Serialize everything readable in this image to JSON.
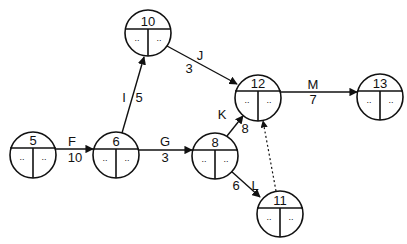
{
  "diagram": {
    "type": "activity-on-arrow network",
    "nodes": [
      {
        "id": "5",
        "label": "5",
        "cx": 33,
        "cy": 155,
        "left": "..",
        "right": ".."
      },
      {
        "id": "6",
        "label": "6",
        "cx": 116,
        "cy": 155,
        "left": "..",
        "right": ".."
      },
      {
        "id": "10",
        "label": "10",
        "cx": 148,
        "cy": 33,
        "left": "..",
        "right": ".."
      },
      {
        "id": "8",
        "label": "8",
        "cx": 215,
        "cy": 156,
        "left": "..",
        "right": ".."
      },
      {
        "id": "12",
        "label": "12",
        "cx": 258,
        "cy": 98,
        "left": "..",
        "right": ".."
      },
      {
        "id": "13",
        "label": "13",
        "cx": 380,
        "cy": 97,
        "left": "..",
        "right": ".."
      },
      {
        "id": "11",
        "label": "11",
        "cx": 280,
        "cy": 214,
        "left": "..",
        "right": ".."
      }
    ],
    "edges": [
      {
        "from": "5",
        "to": "6",
        "activity": "F",
        "duration": "10",
        "dummy": false
      },
      {
        "from": "6",
        "to": "10",
        "activity": "I",
        "duration": "5",
        "dummy": false
      },
      {
        "from": "6",
        "to": "8",
        "activity": "G",
        "duration": "3",
        "dummy": false
      },
      {
        "from": "10",
        "to": "12",
        "activity": "J",
        "duration": "3",
        "dummy": false
      },
      {
        "from": "8",
        "to": "12",
        "activity": "K",
        "duration": "8",
        "dummy": false
      },
      {
        "from": "8",
        "to": "11",
        "activity": "L",
        "duration": "6",
        "dummy": false
      },
      {
        "from": "12",
        "to": "13",
        "activity": "M",
        "duration": "7",
        "dummy": false
      },
      {
        "from": "11",
        "to": "12",
        "activity": "",
        "duration": "",
        "dummy": true
      }
    ]
  }
}
